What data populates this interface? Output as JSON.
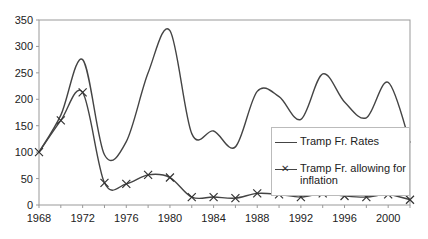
{
  "chart_data": {
    "type": "line",
    "title": "",
    "xlabel": "",
    "ylabel": "",
    "x": [
      1968,
      1970,
      1972,
      1974,
      1976,
      1978,
      1980,
      1982,
      1984,
      1986,
      1988,
      1990,
      1992,
      1994,
      1996,
      1998,
      2000,
      2002
    ],
    "x_tick_labels": [
      "1968",
      "1972",
      "1976",
      "1980",
      "1984",
      "1988",
      "1992",
      "1996",
      "2000"
    ],
    "y_tick_labels": [
      "0",
      "50",
      "100",
      "150",
      "200",
      "250",
      "300",
      "350"
    ],
    "ylim": [
      0,
      350
    ],
    "xlim": [
      1968,
      2002
    ],
    "grid": false,
    "legend_position": "lower right, inside plot",
    "series": [
      {
        "name": "Tramp Fr. Rates",
        "marker": "none",
        "values": [
          100,
          170,
          275,
          95,
          120,
          250,
          330,
          135,
          140,
          110,
          215,
          205,
          162,
          248,
          195,
          165,
          232,
          118
        ]
      },
      {
        "name": "Tramp Fr. allowing for inflation",
        "marker": "x",
        "values": [
          100,
          160,
          213,
          42,
          40,
          57,
          52,
          15,
          15,
          13,
          22,
          20,
          15,
          22,
          17,
          15,
          20,
          10
        ]
      }
    ]
  },
  "legend": {
    "item1": "Tramp Fr. Rates",
    "item2_line1": "Tramp Fr. allowing for",
    "item2_line2": "inflation"
  }
}
